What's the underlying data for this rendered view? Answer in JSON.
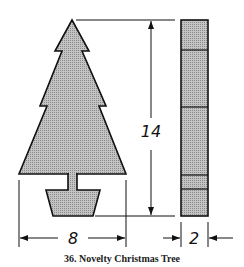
{
  "figure": {
    "caption": "36. Novelty Christmas Tree",
    "colors": {
      "fill": "#b9b9b9",
      "stroke": "#111111"
    },
    "front_view": {
      "label": "tree silhouette with pot base",
      "width_dimension": "8"
    },
    "side_view": {
      "label": "side profile",
      "height_dimension": "14",
      "thickness_dimension": "2"
    }
  }
}
